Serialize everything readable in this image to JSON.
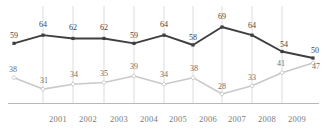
{
  "chart_data": {
    "type": "line",
    "title": "",
    "subtitle": "",
    "xlabel": "",
    "ylabel": "",
    "grid": true,
    "grid_orientation": "vertical",
    "legend_position": "none",
    "x": [
      "",
      "2001",
      "2002",
      "2003",
      "2004",
      "2005",
      "2006",
      "2007",
      "2008",
      "2009",
      ""
    ],
    "categories": [
      "",
      "2001",
      "2002",
      "2003",
      "2004",
      "2005",
      "2006",
      "2007",
      "2008",
      "2009",
      ""
    ],
    "tick_labels": [
      "2001",
      "2002",
      "2003",
      "2004",
      "2005",
      "2006",
      "2007",
      "2008",
      "2009"
    ],
    "ylim": [
      0,
      75
    ],
    "series": [
      {
        "name": "dark-series",
        "color": "#3f3f3f",
        "marker": "square",
        "values": [
          59,
          64,
          62,
          62,
          59,
          64,
          58,
          69,
          64,
          54,
          50
        ],
        "labels": [
          "59",
          "64",
          "62",
          "62",
          "59",
          "64",
          "58",
          "69",
          "64",
          "54",
          "50"
        ]
      },
      {
        "name": "light-series",
        "color": "#c9c9c9",
        "marker": "diamond",
        "values": [
          38,
          31,
          34,
          35,
          39,
          34,
          38,
          28,
          33,
          41,
          47
        ],
        "labels": [
          "38",
          "31",
          "34",
          "35",
          "39",
          "34",
          "38",
          "28",
          "33",
          "41",
          "47"
        ]
      }
    ],
    "annotations": []
  },
  "axis": {
    "baseline_color": "#b8b8b8",
    "gridline_color": "#dcdcdc"
  },
  "labels": {
    "dark": [
      {
        "text": "59",
        "x": 14,
        "y": 32,
        "anchor": "middle"
      },
      {
        "text": "64",
        "x": 43,
        "y": 21,
        "anchor": "middle"
      },
      {
        "text": "62",
        "x": 73,
        "y": 24,
        "anchor": "middle"
      },
      {
        "text": "62",
        "x": 104,
        "y": 24,
        "anchor": "middle"
      },
      {
        "text": "59",
        "x": 134,
        "y": 32,
        "anchor": "middle"
      },
      {
        "text": "64",
        "x": 164,
        "y": 21,
        "anchor": "middle"
      },
      {
        "text": "58",
        "x": 193,
        "y": 34,
        "anchor": "middle"
      },
      {
        "text": "69",
        "x": 222,
        "y": 13,
        "anchor": "middle"
      },
      {
        "text": "64",
        "x": 252,
        "y": 22,
        "anchor": "middle"
      },
      {
        "text": "54",
        "x": 284,
        "y": 41,
        "anchor": "middle"
      },
      {
        "text": "50",
        "x": 315,
        "y": 47,
        "anchor": "middle"
      }
    ],
    "light": [
      {
        "text": "38",
        "x": 13,
        "y": 66,
        "anchor": "middle"
      },
      {
        "text": "31",
        "x": 44,
        "y": 77,
        "anchor": "middle"
      },
      {
        "text": "34",
        "x": 74,
        "y": 71,
        "anchor": "middle"
      },
      {
        "text": "35",
        "x": 104,
        "y": 70,
        "anchor": "middle"
      },
      {
        "text": "39",
        "x": 134,
        "y": 63,
        "anchor": "middle"
      },
      {
        "text": "34",
        "x": 164,
        "y": 71,
        "anchor": "middle"
      },
      {
        "text": "38",
        "x": 194,
        "y": 65,
        "anchor": "middle"
      },
      {
        "text": "28",
        "x": 222,
        "y": 83,
        "anchor": "middle"
      },
      {
        "text": "33",
        "x": 252,
        "y": 74,
        "anchor": "middle"
      },
      {
        "text": "41",
        "x": 281,
        "y": 60,
        "anchor": "middle"
      },
      {
        "text": "47",
        "x": 316,
        "y": 63,
        "anchor": "middle"
      }
    ],
    "xticks": [
      {
        "text": "2001",
        "x": 58
      },
      {
        "text": "2002",
        "x": 88
      },
      {
        "text": "2003",
        "x": 119
      },
      {
        "text": "2004",
        "x": 149
      },
      {
        "text": "2005",
        "x": 178
      },
      {
        "text": "2006",
        "x": 208
      },
      {
        "text": "2007",
        "x": 237
      },
      {
        "text": "2008",
        "x": 267
      },
      {
        "text": "2009",
        "x": 297
      }
    ]
  }
}
